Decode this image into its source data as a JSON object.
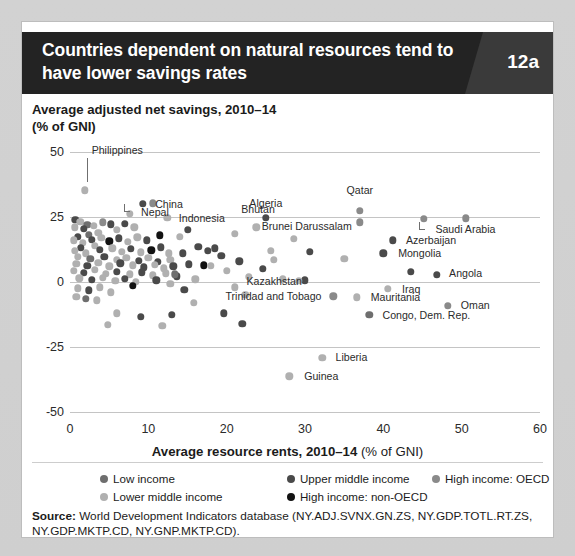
{
  "header": {
    "title": "Countries dependent on natural resources tend to have lower savings rates",
    "badge": "12a"
  },
  "subtitle": {
    "line1": "Average adjusted net savings, 2010–14",
    "line2": "(% of GNI)"
  },
  "source": {
    "label": "Source:",
    "text": " World Development Indicators database (NY.ADJ.SVNX.GN.ZS, NY.GDP.TOTL.RT.ZS, NY.GDP.MKTP.CD, NY.GNP.MKTP.CD)."
  },
  "legend": {
    "items": [
      {
        "label": "Low income",
        "color": "#6e6e6e",
        "col": 0,
        "row": 0
      },
      {
        "label": "Lower middle income",
        "color": "#b0b0b0",
        "col": 0,
        "row": 1
      },
      {
        "label": "Upper middle income",
        "color": "#4a4a4a",
        "col": 1,
        "row": 0
      },
      {
        "label": "High income: non-OECD",
        "color": "#121212",
        "col": 1,
        "row": 1
      },
      {
        "label": "High income: OECD",
        "color": "#8a8a8a",
        "col": 2,
        "row": 0
      }
    ]
  },
  "chart_data": {
    "type": "scatter",
    "title": "Countries dependent on natural resources tend to have lower savings rates",
    "xlabel": "Average resource rents, 2010–14 (% of GNI)",
    "ylabel": "Average adjusted net savings, 2010–14 (% of GNI)",
    "xlim": [
      0,
      60
    ],
    "ylim": [
      -50,
      50
    ],
    "xticks": [
      0,
      10,
      20,
      30,
      40,
      50,
      60
    ],
    "yticks": [
      50,
      25,
      0,
      -25,
      -50
    ],
    "grid": "horizontal",
    "legend_position": "bottom",
    "series": [
      {
        "name": "Low income",
        "color": "#6e6e6e"
      },
      {
        "name": "Lower middle income",
        "color": "#b0b0b0"
      },
      {
        "name": "Upper middle income",
        "color": "#4a4a4a"
      },
      {
        "name": "High income: non-OECD",
        "color": "#121212"
      },
      {
        "name": "High income: OECD",
        "color": "#8a8a8a"
      }
    ],
    "annotations": [
      {
        "label": "Philippines",
        "x": 2.0,
        "y": 35.5,
        "side": "right",
        "leader": "down"
      },
      {
        "label": "China",
        "x": 9.6,
        "y": 30.0,
        "side": "right"
      },
      {
        "label": "Nepal",
        "x": 7.8,
        "y": 26.5,
        "side": "right",
        "leader": "elbow"
      },
      {
        "label": "Indonesia",
        "x": 13.0,
        "y": 24.6,
        "side": "right"
      },
      {
        "label": "Bhutan",
        "x": 24.0,
        "y": 22.0,
        "side": "left-above"
      },
      {
        "label": "Algeria",
        "x": 25.0,
        "y": 24.8,
        "side": "above"
      },
      {
        "label": "Qatar",
        "x": 37.0,
        "y": 26.5,
        "side": "above"
      },
      {
        "label": "Brunei Darussalam",
        "x": 37.0,
        "y": 22.0,
        "side": "left"
      },
      {
        "label": "Saudi Arabia",
        "x": 45.5,
        "y": 24.0,
        "side": "right",
        "leader": "elbow"
      },
      {
        "label": "Azerbaijan",
        "x": 42.0,
        "y": 16.0,
        "side": "right"
      },
      {
        "label": "Mongolia",
        "x": 41.0,
        "y": 11.0,
        "side": "right"
      },
      {
        "label": "Angola",
        "x": 47.5,
        "y": 2.5,
        "side": "right"
      },
      {
        "label": "Kazakhstan",
        "x": 30.5,
        "y": 0.5,
        "side": "left"
      },
      {
        "label": "Iraq",
        "x": 41.5,
        "y": -2.5,
        "side": "right"
      },
      {
        "label": "Trinidad and Tobago",
        "x": 33.0,
        "y": -5.5,
        "side": "left"
      },
      {
        "label": "Mauritania",
        "x": 37.5,
        "y": -5.8,
        "side": "right"
      },
      {
        "label": "Oman",
        "x": 49.0,
        "y": -9.0,
        "side": "right"
      },
      {
        "label": "Congo, Dem. Rep.",
        "x": 39.0,
        "y": -12.5,
        "side": "right"
      },
      {
        "label": "Liberia",
        "x": 33.0,
        "y": -29.0,
        "side": "right"
      },
      {
        "label": "Guinea",
        "x": 29.0,
        "y": -36.0,
        "side": "right"
      }
    ],
    "points": [
      {
        "x": 1.9,
        "y": 35.3,
        "g": 1
      },
      {
        "x": 9.3,
        "y": 30.0,
        "g": 2
      },
      {
        "x": 10.6,
        "y": 30.2,
        "g": 4
      },
      {
        "x": 7.6,
        "y": 26.3,
        "g": 1
      },
      {
        "x": 12.4,
        "y": 24.7,
        "g": 1
      },
      {
        "x": 25.0,
        "y": 24.8,
        "g": 2
      },
      {
        "x": 37.0,
        "y": 27.5,
        "g": 4
      },
      {
        "x": 37.0,
        "y": 23.0,
        "g": 4
      },
      {
        "x": 45.2,
        "y": 24.2,
        "g": 4
      },
      {
        "x": 50.5,
        "y": 24.5,
        "g": 4
      },
      {
        "x": 41.2,
        "y": 16.0,
        "g": 2
      },
      {
        "x": 40.0,
        "y": 11.0,
        "g": 2
      },
      {
        "x": 46.8,
        "y": 2.8,
        "g": 2
      },
      {
        "x": 30.0,
        "y": 0.6,
        "g": 2
      },
      {
        "x": 40.6,
        "y": -2.6,
        "g": 1
      },
      {
        "x": 33.6,
        "y": -5.5,
        "g": 4
      },
      {
        "x": 36.6,
        "y": -5.9,
        "g": 1
      },
      {
        "x": 48.2,
        "y": -9.2,
        "g": 4
      },
      {
        "x": 38.2,
        "y": -12.6,
        "g": 0
      },
      {
        "x": 32.2,
        "y": -29.2,
        "g": 1
      },
      {
        "x": 28.0,
        "y": -36.2,
        "g": 1
      },
      {
        "x": 23.8,
        "y": 21.0,
        "g": 1
      },
      {
        "x": 21.0,
        "y": 18.5,
        "g": 1
      },
      {
        "x": 28.6,
        "y": 16.5,
        "g": 1
      },
      {
        "x": 26.0,
        "y": 8.5,
        "g": 1
      },
      {
        "x": 19.3,
        "y": 10.0,
        "g": 2
      },
      {
        "x": 17.6,
        "y": 12.0,
        "g": 2
      },
      {
        "x": 16.4,
        "y": 13.5,
        "g": 2
      },
      {
        "x": 18.5,
        "y": 13.0,
        "g": 2
      },
      {
        "x": 14.4,
        "y": 11.0,
        "g": 2
      },
      {
        "x": 12.8,
        "y": 8.5,
        "g": 1
      },
      {
        "x": 15.2,
        "y": 6.8,
        "g": 2
      },
      {
        "x": 17.1,
        "y": 6.4,
        "g": 3
      },
      {
        "x": 18.0,
        "y": 6.2,
        "g": 1
      },
      {
        "x": 20.0,
        "y": 4.2,
        "g": 1
      },
      {
        "x": 16.0,
        "y": 1.0,
        "g": 1
      },
      {
        "x": 21.0,
        "y": -2.0,
        "g": 1
      },
      {
        "x": 22.4,
        "y": -5.0,
        "g": 1
      },
      {
        "x": 19.6,
        "y": -12.0,
        "g": 2
      },
      {
        "x": 13.0,
        "y": -12.5,
        "g": 2
      },
      {
        "x": 29.2,
        "y": 0.4,
        "g": 1
      },
      {
        "x": 0.7,
        "y": 24.0,
        "g": 2
      },
      {
        "x": 1.3,
        "y": 23.2,
        "g": 1
      },
      {
        "x": 2.2,
        "y": 22.0,
        "g": 0
      },
      {
        "x": 0.6,
        "y": 21.0,
        "g": 1
      },
      {
        "x": 1.8,
        "y": 20.4,
        "g": 2
      },
      {
        "x": 3.0,
        "y": 21.6,
        "g": 1
      },
      {
        "x": 4.2,
        "y": 23.0,
        "g": 4
      },
      {
        "x": 5.2,
        "y": 22.2,
        "g": 2
      },
      {
        "x": 6.0,
        "y": 20.0,
        "g": 1
      },
      {
        "x": 7.0,
        "y": 22.5,
        "g": 2
      },
      {
        "x": 8.2,
        "y": 21.0,
        "g": 1
      },
      {
        "x": 3.6,
        "y": 19.0,
        "g": 1
      },
      {
        "x": 2.4,
        "y": 18.2,
        "g": 0
      },
      {
        "x": 1.0,
        "y": 17.4,
        "g": 2
      },
      {
        "x": 0.5,
        "y": 16.0,
        "g": 1
      },
      {
        "x": 1.6,
        "y": 15.0,
        "g": 1
      },
      {
        "x": 2.8,
        "y": 16.2,
        "g": 2
      },
      {
        "x": 4.0,
        "y": 17.0,
        "g": 1
      },
      {
        "x": 5.0,
        "y": 15.6,
        "g": 3
      },
      {
        "x": 6.2,
        "y": 16.8,
        "g": 2
      },
      {
        "x": 7.4,
        "y": 15.4,
        "g": 1
      },
      {
        "x": 8.6,
        "y": 17.2,
        "g": 1
      },
      {
        "x": 9.8,
        "y": 16.0,
        "g": 2
      },
      {
        "x": 3.2,
        "y": 14.0,
        "g": 1
      },
      {
        "x": 1.4,
        "y": 13.2,
        "g": 2
      },
      {
        "x": 0.6,
        "y": 12.0,
        "g": 1
      },
      {
        "x": 2.0,
        "y": 11.0,
        "g": 1
      },
      {
        "x": 3.8,
        "y": 12.4,
        "g": 2
      },
      {
        "x": 5.4,
        "y": 13.0,
        "g": 1
      },
      {
        "x": 6.6,
        "y": 11.6,
        "g": 1
      },
      {
        "x": 7.8,
        "y": 12.8,
        "g": 2
      },
      {
        "x": 9.0,
        "y": 11.4,
        "g": 1
      },
      {
        "x": 10.4,
        "y": 12.2,
        "g": 3
      },
      {
        "x": 11.6,
        "y": 13.4,
        "g": 2
      },
      {
        "x": 12.6,
        "y": 11.0,
        "g": 1
      },
      {
        "x": 1.0,
        "y": 9.6,
        "g": 1
      },
      {
        "x": 2.6,
        "y": 9.0,
        "g": 0
      },
      {
        "x": 4.4,
        "y": 9.8,
        "g": 2
      },
      {
        "x": 6.0,
        "y": 8.6,
        "g": 1
      },
      {
        "x": 7.2,
        "y": 9.4,
        "g": 1
      },
      {
        "x": 8.8,
        "y": 8.2,
        "g": 2
      },
      {
        "x": 10.0,
        "y": 9.2,
        "g": 1
      },
      {
        "x": 11.2,
        "y": 7.8,
        "g": 2
      },
      {
        "x": 0.8,
        "y": 7.0,
        "g": 1
      },
      {
        "x": 2.2,
        "y": 6.2,
        "g": 2
      },
      {
        "x": 3.6,
        "y": 7.4,
        "g": 1
      },
      {
        "x": 5.0,
        "y": 6.0,
        "g": 1
      },
      {
        "x": 6.4,
        "y": 7.2,
        "g": 2
      },
      {
        "x": 8.0,
        "y": 6.4,
        "g": 1
      },
      {
        "x": 9.4,
        "y": 5.6,
        "g": 2
      },
      {
        "x": 10.8,
        "y": 6.6,
        "g": 1
      },
      {
        "x": 12.0,
        "y": 5.2,
        "g": 1
      },
      {
        "x": 13.2,
        "y": 6.0,
        "g": 2
      },
      {
        "x": 0.5,
        "y": 4.4,
        "g": 1
      },
      {
        "x": 1.8,
        "y": 3.6,
        "g": 2
      },
      {
        "x": 3.2,
        "y": 4.8,
        "g": 1
      },
      {
        "x": 4.6,
        "y": 3.2,
        "g": 1
      },
      {
        "x": 6.0,
        "y": 4.0,
        "g": 2
      },
      {
        "x": 7.6,
        "y": 3.0,
        "g": 1
      },
      {
        "x": 9.2,
        "y": 3.8,
        "g": 2
      },
      {
        "x": 10.6,
        "y": 2.6,
        "g": 1
      },
      {
        "x": 12.2,
        "y": 3.4,
        "g": 1
      },
      {
        "x": 13.6,
        "y": 2.2,
        "g": 2
      },
      {
        "x": 1.2,
        "y": 1.4,
        "g": 1
      },
      {
        "x": 2.8,
        "y": 0.8,
        "g": 2
      },
      {
        "x": 4.2,
        "y": 1.6,
        "g": 1
      },
      {
        "x": 5.8,
        "y": 0.4,
        "g": 1
      },
      {
        "x": 7.0,
        "y": 1.2,
        "g": 2
      },
      {
        "x": 8.4,
        "y": 0.0,
        "g": 1
      },
      {
        "x": 11.0,
        "y": 0.6,
        "g": 2
      },
      {
        "x": 12.8,
        "y": -0.6,
        "g": 1
      },
      {
        "x": 1.0,
        "y": -2.4,
        "g": 1
      },
      {
        "x": 2.4,
        "y": -3.2,
        "g": 2
      },
      {
        "x": 3.8,
        "y": -2.0,
        "g": 1
      },
      {
        "x": 5.2,
        "y": -4.0,
        "g": 1
      },
      {
        "x": 0.8,
        "y": -5.6,
        "g": 1
      },
      {
        "x": 2.0,
        "y": -6.4,
        "g": 0
      },
      {
        "x": 3.4,
        "y": -7.0,
        "g": 1
      },
      {
        "x": 6.0,
        "y": -12.0,
        "g": 1
      },
      {
        "x": 9.0,
        "y": -13.5,
        "g": 2
      },
      {
        "x": 14.6,
        "y": -3.0,
        "g": 2
      },
      {
        "x": 15.8,
        "y": -8.0,
        "g": 1
      },
      {
        "x": 4.8,
        "y": -16.5,
        "g": 1
      },
      {
        "x": 22.0,
        "y": -16.0,
        "g": 2
      },
      {
        "x": 11.8,
        "y": -16.8,
        "g": 1
      },
      {
        "x": 24.6,
        "y": 5.0,
        "g": 2
      },
      {
        "x": 27.2,
        "y": 1.0,
        "g": 1
      },
      {
        "x": 22.8,
        "y": 2.0,
        "g": 1
      },
      {
        "x": 21.6,
        "y": 8.0,
        "g": 2
      },
      {
        "x": 25.6,
        "y": 12.0,
        "g": 1
      },
      {
        "x": 30.6,
        "y": 11.5,
        "g": 2
      },
      {
        "x": 35.0,
        "y": 9.0,
        "g": 1
      },
      {
        "x": 43.5,
        "y": 4.0,
        "g": 2
      },
      {
        "x": 14.0,
        "y": 17.5,
        "g": 1
      },
      {
        "x": 15.0,
        "y": 20.0,
        "g": 2
      },
      {
        "x": 11.5,
        "y": 18.0,
        "g": 3
      },
      {
        "x": 13.4,
        "y": 3.0,
        "g": 0
      },
      {
        "x": 8.0,
        "y": -1.5,
        "g": 3
      }
    ]
  }
}
